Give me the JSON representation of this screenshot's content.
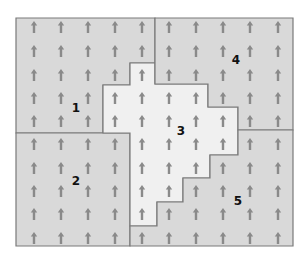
{
  "colors": {
    "background": "#ffffff",
    "region_fill_dark": "#d9d9d9",
    "region_fill_light": "#f0f0f0",
    "border": "#7a7a7a",
    "arrow": "#8a8a8a",
    "label": "#111111"
  },
  "regions": [
    {
      "id": "1",
      "label": "1",
      "fill": "#d9d9d9",
      "label_pos": [
        76,
        112
      ],
      "points": "16,18 155,18 155,63 130,63 130,85 103,85 103,133 16,133"
    },
    {
      "id": "2",
      "label": "2",
      "fill": "#d9d9d9",
      "label_pos": [
        76,
        185
      ],
      "points": "16,133 130,133 130,246 16,246"
    },
    {
      "id": "3",
      "label": "3",
      "fill": "#f0f0f0",
      "label_pos": [
        181,
        135
      ],
      "points": "155,63 155,84 208,84 208,107 238,107 238,155 210,155 210,178 183,178 183,202 157,202 157,226 130,226 130,133 103,133 103,85 130,85 130,63"
    },
    {
      "id": "4",
      "label": "4",
      "fill": "#d9d9d9",
      "label_pos": [
        236,
        64
      ],
      "points": "155,18 293,18 293,130 238,130 238,107 208,107 208,84 155,84"
    },
    {
      "id": "5",
      "label": "5",
      "fill": "#d9d9d9",
      "label_pos": [
        238,
        205
      ],
      "points": "238,130 293,130 293,246 130,246 130,226 157,226 157,202 183,202 183,178 210,178 210,155 238,155"
    }
  ],
  "arrow_grid": {
    "columns": [
      34,
      61,
      88,
      115,
      142,
      169,
      196,
      223,
      250,
      278
    ],
    "rows": [
      27,
      51,
      75,
      98,
      121,
      144,
      168,
      191,
      214,
      238
    ],
    "glyph": "up-arrow-icon"
  }
}
